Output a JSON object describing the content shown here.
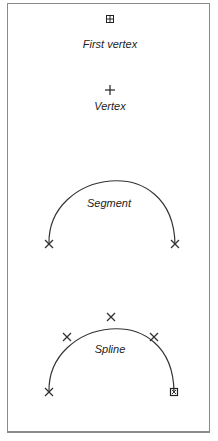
{
  "legend": {
    "first_vertex": {
      "label": "First vertex",
      "icon": "grid-square-icon"
    },
    "vertex": {
      "label": "Vertex",
      "icon": "plus-icon"
    },
    "segment": {
      "label": "Segment",
      "icon": "arc-segment-icon"
    },
    "spline": {
      "label": "Spline",
      "icon": "arc-spline-icon"
    }
  },
  "colors": {
    "stroke": "#333333",
    "border": "#8a8a8a"
  }
}
